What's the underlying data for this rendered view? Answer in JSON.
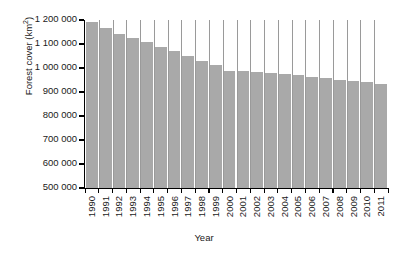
{
  "chart_data": {
    "type": "bar",
    "title": "",
    "xlabel": "Year",
    "ylabel": "Forest cover (km2)",
    "ylabel_text": "Forest cover (km",
    "ylabel_sup": "2",
    "ylabel_close": ")",
    "categories": [
      "1990",
      "1991",
      "1992",
      "1993",
      "1994",
      "1995",
      "1996",
      "1997",
      "1998",
      "1999",
      "2000",
      "2001",
      "2002",
      "2003",
      "2004",
      "2005",
      "2006",
      "2007",
      "2008",
      "2009",
      "2010",
      "2011"
    ],
    "values": [
      1190000,
      1165000,
      1143000,
      1127000,
      1107000,
      1088000,
      1070000,
      1048000,
      1028000,
      1012000,
      987000,
      986000,
      983000,
      981000,
      977000,
      972000,
      963000,
      957000,
      951000,
      944000,
      941000,
      933000
    ],
    "ylim": [
      500000,
      1200000
    ],
    "ytick_values": [
      1200000,
      1100000,
      1000000,
      900000,
      800000,
      700000,
      600000,
      500000
    ],
    "ytick_labels": [
      "1 200 000",
      "1 100 000",
      "1 000 000",
      "900 000",
      "800 000",
      "700 000",
      "600 000",
      "500 000"
    ],
    "grid": false,
    "legend": null,
    "bar_color": "#a9a9a9",
    "separator_color": "#9a9a9a",
    "axis_color": "#000000",
    "background": "#ffffff"
  }
}
